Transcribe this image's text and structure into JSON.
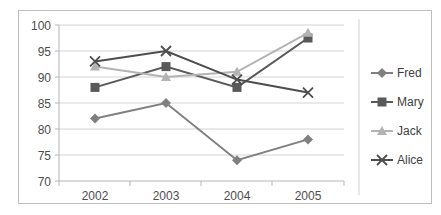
{
  "chart_data": {
    "type": "line",
    "title": "",
    "xlabel": "",
    "ylabel": "",
    "categories": [
      "2002",
      "2003",
      "2004",
      "2005"
    ],
    "ylim": [
      70,
      100
    ],
    "yticks": [
      70,
      75,
      80,
      85,
      90,
      95,
      100
    ],
    "ytick_labels": [
      "70",
      "75",
      "80",
      "85",
      "90",
      "95",
      "100"
    ],
    "grid": true,
    "legend_position": "right",
    "series": [
      {
        "name": "Fred",
        "values": [
          82,
          85,
          74,
          78
        ],
        "color": "#808080",
        "marker": "diamond"
      },
      {
        "name": "Mary",
        "values": [
          88,
          92,
          88,
          97.5
        ],
        "color": "#595959",
        "marker": "square"
      },
      {
        "name": "Jack",
        "values": [
          92,
          90,
          91,
          98.5
        ],
        "color": "#b3b3b3",
        "marker": "triangle"
      },
      {
        "name": "Alice",
        "values": [
          93,
          95,
          89.5,
          87
        ],
        "color": "#4d4d4d",
        "marker": "cross"
      }
    ]
  },
  "axis": {
    "y_tick_0": "100",
    "y_tick_1": "95",
    "y_tick_2": "90",
    "y_tick_3": "85",
    "y_tick_4": "80",
    "y_tick_5": "75",
    "y_tick_6": "70",
    "x_tick_0": "2002",
    "x_tick_1": "2003",
    "x_tick_2": "2004",
    "x_tick_3": "2005"
  },
  "legend": {
    "items": [
      {
        "label": "Fred"
      },
      {
        "label": "Mary"
      },
      {
        "label": "Jack"
      },
      {
        "label": "Alice"
      }
    ]
  }
}
